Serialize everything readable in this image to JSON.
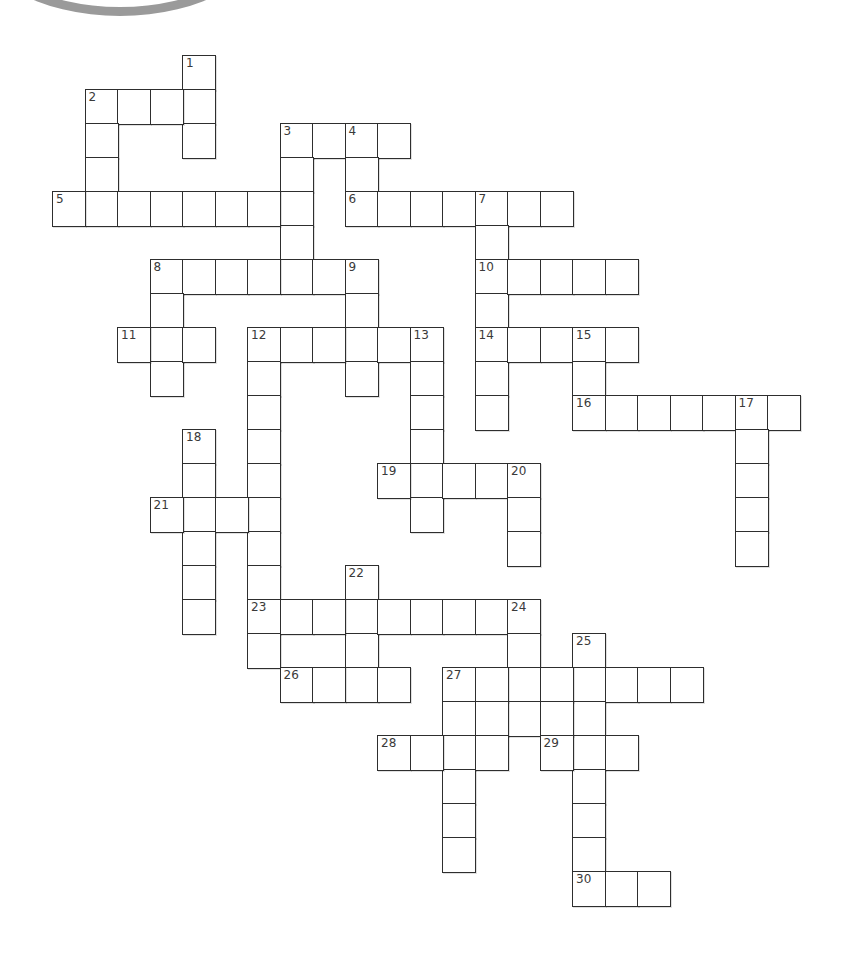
{
  "puzzle": {
    "type": "crossword",
    "grid": {
      "origin_x": 52,
      "origin_y": 55,
      "cell_width": 32.5,
      "cell_height": 34,
      "line_color": "#2e2e2e",
      "number_color": "#3a3a3a"
    },
    "entries": [
      {
        "number": "1",
        "direction": "down",
        "col": 4,
        "row": 0,
        "length": 3
      },
      {
        "number": "2",
        "direction": "across",
        "col": 1,
        "row": 1,
        "length": 4
      },
      {
        "number": "2",
        "direction": "down",
        "col": 1,
        "row": 1,
        "length": 4
      },
      {
        "number": "3",
        "direction": "across",
        "col": 7,
        "row": 2,
        "length": 4
      },
      {
        "number": "3",
        "direction": "down",
        "col": 7,
        "row": 2,
        "length": 5
      },
      {
        "number": "4",
        "direction": "down",
        "col": 9,
        "row": 2,
        "length": 3
      },
      {
        "number": "5",
        "direction": "across",
        "col": 0,
        "row": 4,
        "length": 8
      },
      {
        "number": "6",
        "direction": "across",
        "col": 9,
        "row": 4,
        "length": 7
      },
      {
        "number": "7",
        "direction": "down",
        "col": 13,
        "row": 4,
        "length": 7
      },
      {
        "number": "8",
        "direction": "across",
        "col": 3,
        "row": 6,
        "length": 7
      },
      {
        "number": "8",
        "direction": "down",
        "col": 3,
        "row": 6,
        "length": 4
      },
      {
        "number": "9",
        "direction": "down",
        "col": 9,
        "row": 6,
        "length": 4
      },
      {
        "number": "10",
        "direction": "across",
        "col": 13,
        "row": 6,
        "length": 5
      },
      {
        "number": "11",
        "direction": "across",
        "col": 2,
        "row": 8,
        "length": 3
      },
      {
        "number": "12",
        "direction": "across",
        "col": 6,
        "row": 8,
        "length": 6
      },
      {
        "number": "12",
        "direction": "down",
        "col": 6,
        "row": 8,
        "length": 10
      },
      {
        "number": "13",
        "direction": "down",
        "col": 11,
        "row": 8,
        "length": 6
      },
      {
        "number": "14",
        "direction": "across",
        "col": 13,
        "row": 8,
        "length": 5
      },
      {
        "number": "15",
        "direction": "down",
        "col": 16,
        "row": 8,
        "length": 3
      },
      {
        "number": "16",
        "direction": "across",
        "col": 16,
        "row": 10,
        "length": 7
      },
      {
        "number": "17",
        "direction": "down",
        "col": 21,
        "row": 10,
        "length": 5
      },
      {
        "number": "18",
        "direction": "down",
        "col": 4,
        "row": 11,
        "length": 6
      },
      {
        "number": "19",
        "direction": "across",
        "col": 10,
        "row": 12,
        "length": 5
      },
      {
        "number": "20",
        "direction": "down",
        "col": 14,
        "row": 12,
        "length": 3
      },
      {
        "number": "21",
        "direction": "across",
        "col": 3,
        "row": 13,
        "length": 4
      },
      {
        "number": "22",
        "direction": "down",
        "col": 9,
        "row": 15,
        "length": 4
      },
      {
        "number": "23",
        "direction": "across",
        "col": 6,
        "row": 16,
        "length": 9
      },
      {
        "number": "24",
        "direction": "down",
        "col": 14,
        "row": 16,
        "length": 4
      },
      {
        "number": "25",
        "direction": "down",
        "col": 16,
        "row": 17,
        "length": 8
      },
      {
        "number": "26",
        "direction": "across",
        "col": 7,
        "row": 18,
        "length": 4
      },
      {
        "number": "27",
        "direction": "across",
        "col": 12,
        "row": 18,
        "length": 8
      },
      {
        "number": "27",
        "direction": "down",
        "col": 12,
        "row": 18,
        "length": 6
      },
      {
        "number": "",
        "direction": "across",
        "col": 12,
        "row": 19,
        "length": 5
      },
      {
        "number": "28",
        "direction": "across",
        "col": 10,
        "row": 20,
        "length": 4
      },
      {
        "number": "29",
        "direction": "across",
        "col": 15,
        "row": 20,
        "length": 3
      },
      {
        "number": "30",
        "direction": "across",
        "col": 16,
        "row": 24,
        "length": 3
      }
    ]
  }
}
